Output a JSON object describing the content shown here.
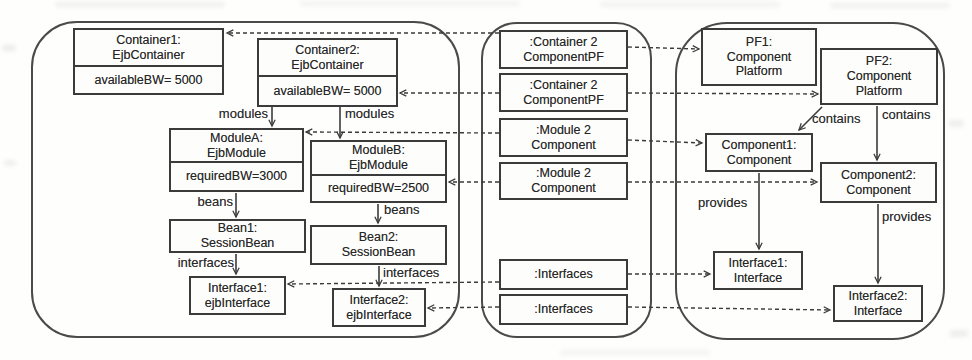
{
  "colors": {
    "ink": "#3b3b3b",
    "paper": "#fdfdfb"
  },
  "ejb_model": {
    "container1": {
      "name": "Container1:",
      "type": "EjbContainer",
      "attribute": "availableBW= 5000"
    },
    "container2": {
      "name": "Container2:",
      "type": "EjbContainer",
      "attribute": "availableBW= 5000"
    },
    "moduleA": {
      "name": "ModuleA:",
      "type": "EjbModule",
      "attribute": "requiredBW=3000"
    },
    "moduleB": {
      "name": "ModuleB:",
      "type": "EjbModule",
      "attribute": "requiredBW=2500"
    },
    "bean1": {
      "name": "Bean1:",
      "type": "SessionBean"
    },
    "bean2": {
      "name": "Bean2:",
      "type": "SessionBean"
    },
    "interface1": {
      "name": "Interface1:",
      "type": "ejbInterface"
    },
    "interface2": {
      "name": "Interface2:",
      "type": "ejbInterface"
    }
  },
  "correspondence_model": {
    "boxes": [
      {
        "line1": ":Container 2",
        "line2": "ComponentPF"
      },
      {
        "line1": ":Container 2",
        "line2": "ComponentPF"
      },
      {
        "line1": ":Module 2",
        "line2": "Component"
      },
      {
        "line1": ":Module 2",
        "line2": "Component"
      },
      {
        "line1": ":Interfaces"
      },
      {
        "line1": ":Interfaces"
      }
    ]
  },
  "component_model": {
    "pf1": {
      "name": "PF1:",
      "type_line1": "Component",
      "type_line2": "Platform"
    },
    "pf2": {
      "name": "PF2:",
      "type_line1": "Component",
      "type_line2": "Platform"
    },
    "component1": {
      "name": "Component1:",
      "type": "Component"
    },
    "component2": {
      "name": "Component2:",
      "type": "Component"
    },
    "interface1": {
      "name": "Interface1:",
      "type": "Interface"
    },
    "interface2": {
      "name": "Interface2:",
      "type": "Interface"
    }
  },
  "edge_labels": {
    "modules": "modules",
    "beans": "beans",
    "interfaces": "interfaces",
    "contains": "contains",
    "provides": "provides"
  }
}
